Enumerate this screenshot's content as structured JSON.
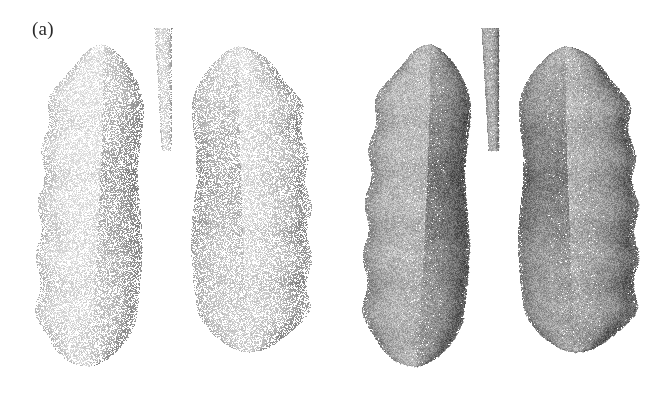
{
  "figure": {
    "background_color": "#ffffff",
    "width": 654,
    "height": 398,
    "panel_count": 2
  },
  "panels": [
    {
      "id": "a",
      "label": "(a)",
      "label_x": 32,
      "label_y": 18,
      "render_name": "lung-pointcloud-sparse",
      "description": "Sparse point-cloud surface rendering of both lungs with trachea",
      "point_density": 0.55,
      "point_size": 1.0,
      "base_gray": "#a8a8a8",
      "shadow_gray": "#5e5e5e",
      "highlight_gray": "#d8d8d8",
      "noise_amount": 0.3,
      "origin_x": 0,
      "origin_y": 0
    },
    {
      "id": "b",
      "label": "(b)",
      "label_x": 347,
      "label_y": 18,
      "render_name": "lung-pointcloud-dense",
      "description": "Dense grainy point-cloud surface rendering of both lungs with trachea",
      "point_density": 0.95,
      "point_size": 1.25,
      "base_gray": "#8e8e8e",
      "shadow_gray": "#4a4a4a",
      "highlight_gray": "#bdbdbd",
      "noise_amount": 0.52,
      "origin_x": 327,
      "origin_y": 0
    }
  ],
  "chart_data": {
    "type": "scatter",
    "title": "",
    "xlabel": "",
    "ylabel": "",
    "legend": [],
    "grid": false,
    "note": "3D volumetric point-cloud surface reconstruction of human lungs, shown as two rendering variants",
    "geometry": {
      "trachea": {
        "name": "trachea",
        "top_y": 28,
        "bottom_y": 150,
        "center_x": 163,
        "half_width_top": 9,
        "half_width_bottom": 5
      },
      "left_lung": {
        "name": "left-lung",
        "apex_y": 44,
        "base_y": 366,
        "outer_x": 47,
        "inner_x": 158,
        "lobe_ridges": 6
      },
      "right_lung": {
        "name": "right-lung",
        "apex_y": 46,
        "base_y": 352,
        "outer_x": 303,
        "inner_x": 172,
        "lobe_ridges": 6
      },
      "hilar_gap": {
        "name": "interlobar-fissure-gap",
        "top_y": 160,
        "bottom_y": 320,
        "max_width": 14
      }
    }
  }
}
